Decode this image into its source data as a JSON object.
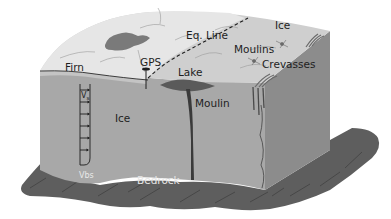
{
  "diagram": {
    "labels": {
      "firn": "Firn",
      "gps": "GPS",
      "eq_line": "Eq. Line",
      "ice_surface": "Ice",
      "moulins": "Moulins",
      "crevasses": "Crevasses",
      "lake": "Lake",
      "moulin": "Moulin",
      "ice_body": "Ice",
      "bedrock": "Bedrock",
      "vs_main": "V",
      "vs_sub": "s",
      "vbs": "Vbs"
    },
    "colors": {
      "surface_snow": "#e4e4e4",
      "surface_ice": "#cfcfcf",
      "front_face": "#a8a8a8",
      "side_face": "#8c8c8c",
      "bedrock": "#5e5e5e",
      "bedrock_dark": "#4a4a4a",
      "lake": "#6a6a6a",
      "moulin": "#3a3a3a",
      "text": "#1e1e1e"
    },
    "velocity_profile_arrows": 7
  }
}
